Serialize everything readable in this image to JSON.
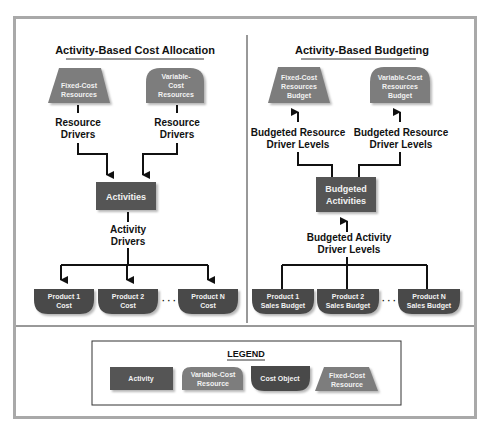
{
  "left_panel": {
    "title": "Activity-Based Cost Allocation",
    "fixed_resource": [
      "Fixed-Cost",
      "Resources"
    ],
    "variable_resource": [
      "Variable-",
      "Cost",
      "Resources"
    ],
    "resource_driver_left": [
      "Resource",
      "Drivers"
    ],
    "resource_driver_right": [
      "Resource",
      "Drivers"
    ],
    "activities": "Activities",
    "activity_drivers": [
      "Activity",
      "Drivers"
    ],
    "products": [
      [
        "Product 1",
        "Cost"
      ],
      [
        "Product 2",
        "Cost"
      ],
      [
        "Product N",
        "Cost"
      ]
    ],
    "ellipsis": "· · ·"
  },
  "right_panel": {
    "title": "Activity-Based Budgeting",
    "fixed_resource": [
      "Fixed-Cost",
      "Resources",
      "Budget"
    ],
    "variable_resource": [
      "Variable-Cost",
      "Resources",
      "Budget"
    ],
    "driver_levels_left": [
      "Budgeted Resource",
      "Driver Levels"
    ],
    "driver_levels_right": [
      "Budgeted Resource",
      "Driver Levels"
    ],
    "activities": [
      "Budgeted",
      "Activities"
    ],
    "activity_driver_levels": [
      "Budgeted Activity",
      "Driver Levels"
    ],
    "products": [
      [
        "Product 1",
        "Sales Budget"
      ],
      [
        "Product 2",
        "Sales Budget"
      ],
      [
        "Product N",
        "Sales Budget"
      ]
    ],
    "ellipsis": "· · ·"
  },
  "legend": {
    "title": "LEGEND",
    "items": [
      {
        "shape": "rectangle",
        "label": [
          "Activity"
        ]
      },
      {
        "shape": "dome",
        "label": [
          "Variable-Cost",
          "Resource"
        ]
      },
      {
        "shape": "cost-object",
        "label": [
          "Cost Object"
        ]
      },
      {
        "shape": "trapezoid",
        "label": [
          "Fixed-Cost",
          "Resource"
        ]
      }
    ]
  },
  "colors": {
    "activity": "#555555",
    "resource": "#7d7d7d",
    "cost_object": "#4a4a4a",
    "frame": "#a9a9a9",
    "text_dark": "#111111",
    "text_light": "#f2f2f2"
  }
}
